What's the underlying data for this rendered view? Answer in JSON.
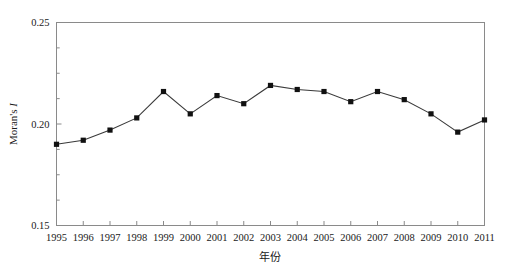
{
  "chart_data": {
    "type": "line",
    "title": "",
    "xlabel": "年份",
    "ylabel": "Moran's I",
    "ylabel_parts": {
      "prefix": "Moran's ",
      "italic": "I"
    },
    "categories": [
      "1995",
      "1996",
      "1997",
      "1998",
      "1999",
      "2000",
      "2001",
      "2002",
      "2003",
      "2004",
      "2005",
      "2006",
      "2007",
      "2008",
      "2009",
      "2010",
      "2011"
    ],
    "values": [
      0.19,
      0.192,
      0.197,
      0.203,
      0.216,
      0.205,
      0.214,
      0.21,
      0.219,
      0.217,
      0.216,
      0.211,
      0.216,
      0.212,
      0.205,
      0.196,
      0.202
    ],
    "series": [
      {
        "name": "Moran's I",
        "values": [
          0.19,
          0.192,
          0.197,
          0.203,
          0.216,
          0.205,
          0.214,
          0.21,
          0.219,
          0.217,
          0.216,
          0.211,
          0.216,
          0.212,
          0.205,
          0.196,
          0.202
        ],
        "line_color": "#3a3a3a",
        "marker_color": "#111111",
        "marker": "square"
      }
    ],
    "ylim": [
      0.15,
      0.25
    ],
    "yticks": [
      0.15,
      0.2,
      0.25
    ],
    "ytick_labels": [
      "0.15",
      "0.20",
      "0.25"
    ],
    "yminor_step": 0.0125,
    "xlim": [
      "1995",
      "2011"
    ],
    "grid": false,
    "legend": null,
    "legend_position": "none",
    "frame": {
      "top": true,
      "right": true,
      "bottom": true,
      "left": true
    },
    "colors": {
      "line": "#3a3a3a",
      "marker": "#111111",
      "axis": "#8a8a8a",
      "text": "#1a1a1a",
      "background": "#ffffff"
    }
  }
}
